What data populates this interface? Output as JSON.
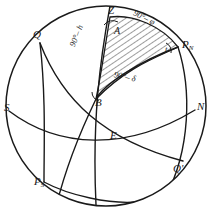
{
  "figure": {
    "type": "celestial-sphere-diagram",
    "background_color": "#ffffff",
    "line_color": "#1a1a1a",
    "hatch_color": "#1a1a1a",
    "sphere": {
      "center_x": 106,
      "center_y": 106,
      "radius": 100
    }
  },
  "points": {
    "zenith": {
      "label": "Z",
      "x": 110,
      "y": 12
    },
    "north_pole": {
      "label": "P",
      "sub": "N",
      "x": 181,
      "y": 45
    },
    "south_pole": {
      "label": "P",
      "sub": "S",
      "x": 37,
      "y": 182
    },
    "equator_q": {
      "label": "Q",
      "x": 38,
      "y": 37
    },
    "equator_q_prime": {
      "label": "Q'",
      "x": 177,
      "y": 170
    },
    "south_point": {
      "label": "S",
      "x": 6,
      "y": 109
    },
    "north_point": {
      "label": "N",
      "x": 199,
      "y": 108
    },
    "body_b": {
      "label": "B",
      "x": 96,
      "y": 104
    },
    "east_e": {
      "label": "E",
      "x": 111,
      "y": 137
    }
  },
  "angles": {
    "azimuth": {
      "label": "A",
      "x": 115,
      "y": 32,
      "at": "Z"
    },
    "hour_angle": {
      "label": "t",
      "x": 166,
      "y": 50,
      "at": "P_N"
    }
  },
  "sides": [
    {
      "name": "zenith-distance",
      "label": "90°– h",
      "x": 74,
      "y": 47,
      "rotate": -68
    },
    {
      "name": "colatitude",
      "label": "90°– φ",
      "x": 139,
      "y": 10,
      "rotate": 27
    },
    {
      "name": "polar-distance",
      "label": "90°– δ",
      "x": 118,
      "y": 72,
      "rotate": 12
    }
  ],
  "hatched_region": {
    "name": "astronomical-triangle",
    "vertices": [
      "Z",
      "P_N",
      "B"
    ],
    "fill": "diagonal-hatch"
  }
}
